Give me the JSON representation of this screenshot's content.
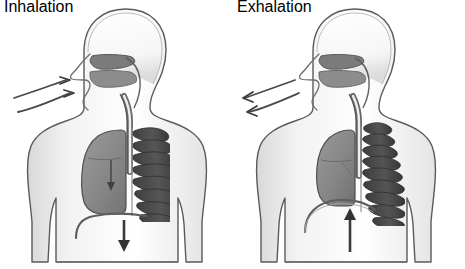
{
  "illustration": {
    "title": "Mechanics of Breathing: Inhalation and Exhalation",
    "subject": "human-torso-respiratory-system",
    "style": "grayscale pencil-shaded medical diagram",
    "background_color": "#ffffff",
    "panel_count": 2
  },
  "palette": {
    "background": "#ffffff",
    "body_outline": "#5a5a5a",
    "body_fill": "#ffffff",
    "body_shadow": "#cfcfcf",
    "lung_fill": "#8a8a8a",
    "lung_outline": "#4f4f4f",
    "rib_dark": "#4a4a4a",
    "rib_light": "#ffffff",
    "trachea_stroke": "#5f5f5f",
    "airway_dark": "#6b6b6b",
    "arrow_color": "#3a3a3a",
    "diaphragm_stroke": "#606060"
  },
  "panels": [
    {
      "id": "inhalation",
      "label": "Inhalation",
      "phase": "breathing in",
      "airflow": {
        "direction": "inward",
        "description": "Two curved arrows point toward the nostrils, showing air entering the nose",
        "arrow_count": 2,
        "arrowhead_points": "right-toward-nose"
      },
      "lung": {
        "state": "expanded",
        "description": "Left lung drawn large and filled, occupying the chest cavity",
        "internal_arrow": "down"
      },
      "rib_cage": {
        "state": "elevated-and-expanded",
        "rib_count": 9,
        "description": "Ribs spread apart and lifted upward and outward"
      },
      "diaphragm": {
        "state": "contracted-flattened",
        "position": "low",
        "description": "Diaphragm pulled downward and flattened"
      },
      "main_arrow": {
        "direction": "down",
        "description": "Large vertical arrow pointing downward below the diaphragm"
      }
    },
    {
      "id": "exhalation",
      "label": "Exhalation",
      "phase": "breathing out",
      "airflow": {
        "direction": "outward",
        "description": "Two curved arrows point away from the nostrils, showing air leaving the nose",
        "arrow_count": 2,
        "arrowhead_points": "left-away-from-nose"
      },
      "lung": {
        "state": "contracted",
        "description": "Left lung drawn smaller and compressed within the chest cavity",
        "internal_arrow": "none"
      },
      "rib_cage": {
        "state": "lowered-and-narrowed",
        "rib_count": 9,
        "description": "Ribs drawn closer together, lowered and pulled inward"
      },
      "diaphragm": {
        "state": "relaxed-domed",
        "position": "high",
        "description": "Diaphragm relaxed and domed upward into the chest"
      },
      "main_arrow": {
        "direction": "up",
        "description": "Large vertical arrow pointing upward beneath the domed diaphragm"
      }
    }
  ],
  "anatomy_labels": {
    "head": "head",
    "nasal_cavity": "nasal cavity",
    "nostril": "nostril",
    "oral_cavity": "oral cavity",
    "pharynx": "pharynx",
    "trachea": "trachea",
    "lung": "lung",
    "rib_cage": "rib cage",
    "diaphragm": "diaphragm",
    "torso": "torso",
    "shoulder": "shoulder",
    "arm": "arm",
    "waist": "waist"
  }
}
